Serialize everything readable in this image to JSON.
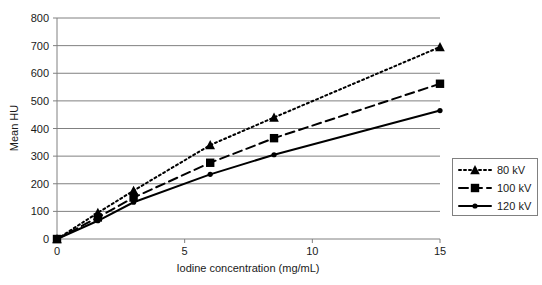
{
  "chart_data": {
    "type": "line",
    "title": "",
    "xlabel": "Iodine concentration (mg/mL)",
    "ylabel": "Mean HU",
    "xlim": [
      0,
      15
    ],
    "ylim": [
      0,
      800
    ],
    "xticks": [
      "0",
      "5",
      "10",
      "15"
    ],
    "xtick_values": [
      0,
      5,
      10,
      15
    ],
    "yticks": [
      "0",
      "100",
      "200",
      "300",
      "400",
      "500",
      "600",
      "700",
      "800"
    ],
    "ytick_values": [
      0,
      100,
      200,
      300,
      400,
      500,
      600,
      700,
      800
    ],
    "grid": "horizontal",
    "legend_position": "right",
    "x": [
      0,
      1.6,
      3.0,
      6.0,
      8.5,
      15.0
    ],
    "series": [
      {
        "name": "80 kV",
        "values": [
          0,
          95,
          175,
          340,
          440,
          695
        ],
        "marker": "triangle",
        "linestyle": "dotted",
        "color": "#000000"
      },
      {
        "name": "100 kV",
        "values": [
          0,
          78,
          150,
          276,
          365,
          562
        ],
        "marker": "square",
        "linestyle": "dashed",
        "color": "#000000"
      },
      {
        "name": "120 kV",
        "values": [
          0,
          66,
          133,
          234,
          305,
          465
        ],
        "marker": "circle",
        "linestyle": "solid",
        "color": "#000000"
      }
    ]
  },
  "axes": {
    "y_title": "Mean HU",
    "x_title": "Iodine concentration (mg/mL)"
  },
  "legend": {
    "entries": [
      {
        "label": "80 kV"
      },
      {
        "label": "100 kV"
      },
      {
        "label": "120 kV"
      }
    ]
  },
  "colors": {
    "ink": "#000000",
    "gridline": "#808080",
    "axis": "#808080",
    "background": "#ffffff"
  }
}
